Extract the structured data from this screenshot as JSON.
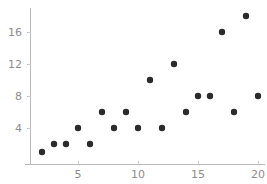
{
  "chart_data": {
    "type": "scatter",
    "title": "",
    "xlabel": "",
    "ylabel": "",
    "xlim": [
      0.5,
      20.8
    ],
    "ylim": [
      0,
      19.2
    ],
    "grid": false,
    "legend": null,
    "xticks": [
      5,
      10,
      15,
      20
    ],
    "yticks": [
      4,
      8,
      12,
      16
    ],
    "xtick_labels": [
      "5",
      "10",
      "15",
      "20"
    ],
    "ytick_labels": [
      "4",
      "8",
      "12",
      "16"
    ],
    "marker": {
      "shape": "circle",
      "color": "#2b2b2b",
      "size": 3.2
    },
    "series": [
      {
        "name": "series-1",
        "points": [
          {
            "x": 2,
            "y": 1
          },
          {
            "x": 3,
            "y": 2
          },
          {
            "x": 4,
            "y": 2
          },
          {
            "x": 5,
            "y": 4
          },
          {
            "x": 6,
            "y": 2
          },
          {
            "x": 7,
            "y": 6
          },
          {
            "x": 8,
            "y": 4
          },
          {
            "x": 9,
            "y": 6
          },
          {
            "x": 10,
            "y": 4
          },
          {
            "x": 11,
            "y": 10
          },
          {
            "x": 12,
            "y": 4
          },
          {
            "x": 13,
            "y": 12
          },
          {
            "x": 14,
            "y": 6
          },
          {
            "x": 15,
            "y": 8
          },
          {
            "x": 16,
            "y": 8
          },
          {
            "x": 17,
            "y": 16
          },
          {
            "x": 18,
            "y": 6
          },
          {
            "x": 19,
            "y": 18
          },
          {
            "x": 20,
            "y": 8
          }
        ]
      }
    ],
    "colors": {
      "marker": "#2b2b2b",
      "axis": "#b9b9b9",
      "tick": "#c9c9c9",
      "tick_label": "#8d8d8d",
      "background": "#ffffff"
    }
  }
}
